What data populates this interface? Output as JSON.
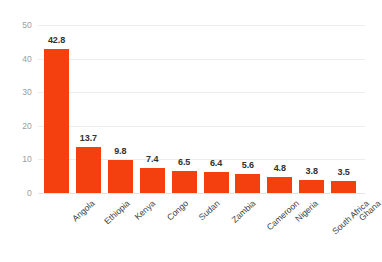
{
  "chart_data": {
    "type": "bar",
    "title": "",
    "subtitle": "",
    "xlabel": "",
    "ylabel": "",
    "categories": [
      "Angola",
      "Ethiopia",
      "Kenya",
      "Congo",
      "Sudan",
      "Zambia",
      "Cameroon",
      "Nigeria",
      "South Africa",
      "Ghana"
    ],
    "values": [
      42.8,
      13.7,
      9.8,
      7.4,
      6.5,
      6.4,
      5.6,
      4.8,
      3.8,
      3.5
    ],
    "value_labels": [
      "42.8",
      "13.7",
      "9.8",
      "7.4",
      "6.5",
      "6.4",
      "5.6",
      "4.8",
      "3.8",
      "3.5"
    ],
    "ylim": [
      0,
      50
    ],
    "ytick_values": [
      0,
      10,
      20,
      30,
      40,
      50
    ],
    "ytick_labels": [
      "0",
      "10",
      "20",
      "30",
      "40",
      "50"
    ],
    "grid": true,
    "grid_axis": "y",
    "legend": false,
    "legend_position": "none",
    "bar_color": "#f4400f",
    "grid_color": "#eceded",
    "axis_label_color": "#9a9da0",
    "value_label_color": "#2f3133",
    "category_label_color": "#3c3f42",
    "background_color": "#ffffff",
    "xtick_label_rotation": -42
  }
}
